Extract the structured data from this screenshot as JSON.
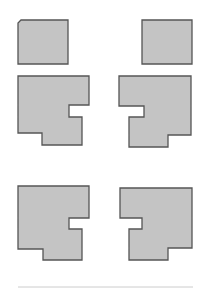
{
  "diagram": {
    "colors": {
      "fill": "#c4c4c4",
      "stroke": "#555555",
      "divider": "#cccccc",
      "background": "#ffffff"
    },
    "shapes": [
      {
        "id": "top-left-square",
        "points": "21,20 68,20 68,64 18,64 18,23"
      },
      {
        "id": "top-right-square",
        "points": "142,20 192,20 192,64 142,64"
      },
      {
        "id": "middle-left-l-shape",
        "points": "18,76 89,76 89,105 69,105 69,117 82,117 82,145 42,145 42,133 18,133"
      },
      {
        "id": "middle-right-l-shape",
        "points": "119,76 191,76 191,135 168,135 168,147 129,147 129,117 144,117 144,106 119,106"
      },
      {
        "id": "bottom-left-l-shape",
        "points": "18,186 89,186 89,218 69,218 69,229 82,229 82,260 43,260 43,249 18,249"
      },
      {
        "id": "bottom-right-l-shape",
        "points": "120,188 192,188 192,248 168,248 168,260 129,260 129,229 142,229 142,218 120,218"
      }
    ],
    "divider": {
      "x1": 18,
      "y1": 287,
      "x2": 193,
      "y2": 287
    }
  }
}
